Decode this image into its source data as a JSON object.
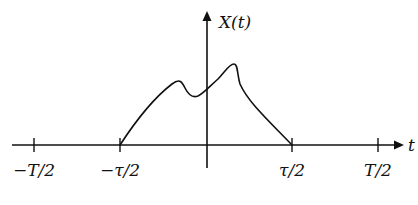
{
  "diagram": {
    "y_axis_label": "X(t)",
    "x_axis_label": "t",
    "tick_labels": [
      "−T/2",
      "−τ/2",
      "τ/2",
      "T/2"
    ],
    "colors": {
      "stroke": "#111111",
      "background": "#ffffff"
    }
  }
}
